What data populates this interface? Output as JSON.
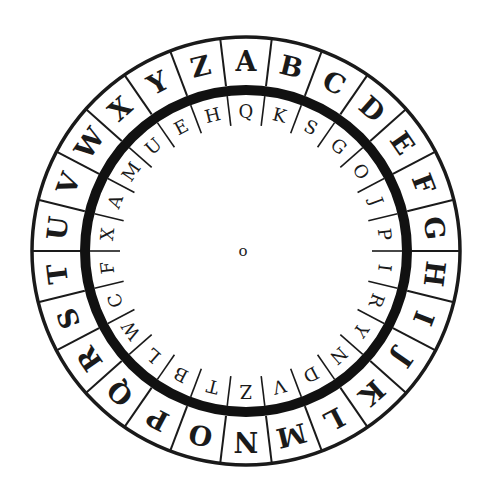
{
  "geometry": {
    "cx": 246,
    "cy": 251,
    "outer_radius": 214,
    "band_outer_radius": 166,
    "band_inner_radius": 156,
    "inner_ring_inner_radius": 126,
    "outer_letter_radius": 190,
    "inner_letter_radius": 140,
    "start_angle_deg": 0,
    "ink_color": "#1a1a1a",
    "background": "#ffffff"
  },
  "outer_ring": {
    "letters": [
      "A",
      "B",
      "C",
      "D",
      "E",
      "F",
      "G",
      "H",
      "I",
      "J",
      "K",
      "L",
      "M",
      "N",
      "O",
      "P",
      "Q",
      "R",
      "S",
      "T",
      "U",
      "V",
      "W",
      "X",
      "Y",
      "Z"
    ]
  },
  "inner_ring": {
    "letters": [
      "Q",
      "K",
      "S",
      "G",
      "O",
      "J",
      "P",
      "I",
      "R",
      "Y",
      "N",
      "D",
      "V",
      "Z",
      "T",
      "B",
      "L",
      "W",
      "C",
      "F",
      "X",
      "A",
      "M",
      "U",
      "E",
      "H"
    ]
  },
  "center": {
    "label": "o"
  }
}
